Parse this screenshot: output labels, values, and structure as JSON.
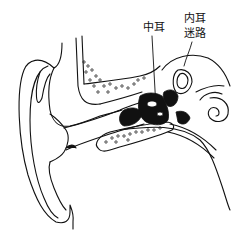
{
  "figure": {
    "labels": {
      "middle_ear": "中耳",
      "inner_ear": "内耳",
      "labyrinth": "迷路"
    },
    "colors": {
      "line": "#111111",
      "background": "#ffffff"
    }
  }
}
